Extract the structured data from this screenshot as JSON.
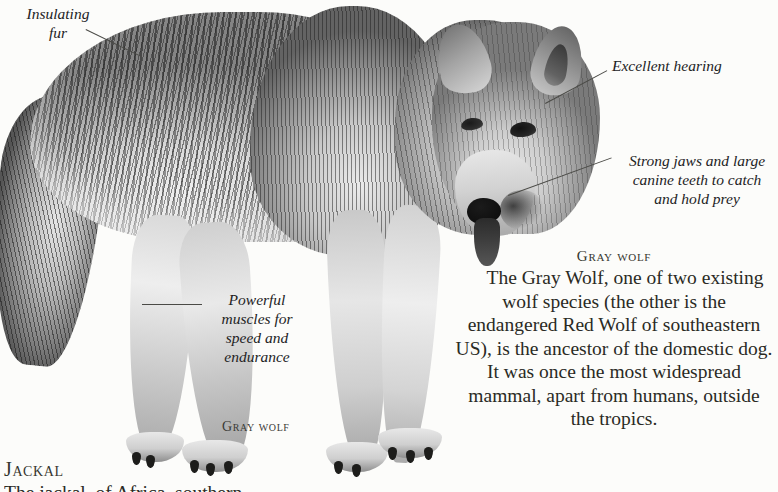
{
  "page": {
    "background_color": "#fcfcfa",
    "ink_color": "#2a2a24"
  },
  "photo": {
    "subject": "gray-wolf-photograph",
    "style": "grayscale-halftone"
  },
  "annotations": [
    {
      "id": "insulating-fur",
      "text": "Insulating\nfur",
      "align": "center"
    },
    {
      "id": "excellent-hearing",
      "text": "Excellent hearing",
      "align": "left"
    },
    {
      "id": "strong-jaws",
      "text": "Strong jaws and large\ncanine teeth to catch\nand hold prey",
      "align": "center"
    },
    {
      "id": "powerful-muscles",
      "text": "Powerful\nmuscles for\nspeed and\nendurance",
      "align": "center"
    }
  ],
  "captions": {
    "photo_caption": "Gray wolf"
  },
  "body": {
    "heading": "Gray wolf",
    "paragraph": "The Gray Wolf, one of two existing wolf species (the other is the endangered Red Wolf of southeastern US), is the ancestor of the domestic dog. It was once the most widespread mammal, apart from humans, outside the tropics."
  },
  "next_entry": {
    "heading": "Jackal",
    "paragraph_partial": "The jackal, of Africa, southern"
  }
}
